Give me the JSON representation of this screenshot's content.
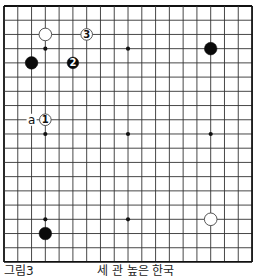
{
  "board": {
    "size": 19,
    "origin_x": 4,
    "origin_y": 6,
    "step_x": 13.78,
    "step_y": 14.22,
    "line_color": "#333333",
    "edge_color": "#111111",
    "hoshi": [
      [
        3,
        3
      ],
      [
        9,
        3
      ],
      [
        3,
        9
      ],
      [
        9,
        9
      ],
      [
        15,
        9
      ],
      [
        3,
        15
      ],
      [
        9,
        15
      ]
    ],
    "stones": [
      {
        "color": "white",
        "col": 3,
        "row": 2,
        "label": ""
      },
      {
        "color": "white",
        "col": 6,
        "row": 2,
        "label": "3"
      },
      {
        "color": "black",
        "col": 2,
        "row": 4,
        "label": ""
      },
      {
        "color": "black",
        "col": 5,
        "row": 4,
        "label": "2"
      },
      {
        "color": "black",
        "col": 15,
        "row": 3,
        "label": ""
      },
      {
        "color": "white",
        "col": 3,
        "row": 8,
        "label": "1"
      },
      {
        "color": "black",
        "col": 3,
        "row": 16,
        "label": ""
      },
      {
        "color": "white",
        "col": 15,
        "row": 15,
        "label": ""
      }
    ],
    "markers": [
      {
        "col": 2,
        "row": 8,
        "text": "a"
      }
    ]
  },
  "caption": {
    "left": "그림3",
    "right": "세 관 높은 한국"
  }
}
